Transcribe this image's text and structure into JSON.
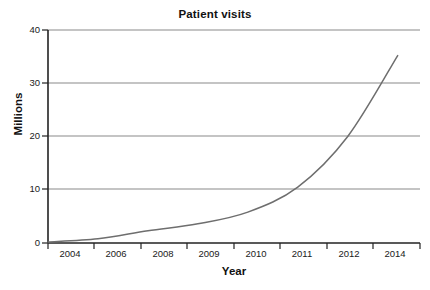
{
  "chart_data": {
    "type": "line",
    "title": "Patient visits",
    "xlabel": "Year",
    "ylabel": "Millions",
    "categories": [
      "2004",
      "2006",
      "2008",
      "2009",
      "2010",
      "2011",
      "2012",
      "2014"
    ],
    "x": [
      2004,
      2006,
      2008,
      2009,
      2010,
      2011,
      2012,
      2014
    ],
    "values": [
      0.2,
      0.8,
      2.3,
      3.6,
      5.8,
      10.5,
      20.0,
      35.2
    ],
    "series": [
      {
        "name": "Patient visits",
        "values": [
          0.2,
          0.8,
          2.3,
          3.6,
          5.8,
          10.5,
          20.0,
          35.2
        ]
      }
    ],
    "ylim": [
      0,
      40
    ],
    "yticks": [
      0,
      10,
      20,
      30,
      40
    ],
    "ytick_labels": [
      "0",
      "10",
      "20",
      "30",
      "40"
    ],
    "xtick_labels": [
      "2004",
      "2006",
      "2008",
      "2009",
      "2010",
      "2011",
      "2012",
      "2014"
    ],
    "grid": "horizontal",
    "legend": "none",
    "line_color": "#6e6e6e",
    "grid_color": "#8a8a8a",
    "axis_color": "#222222",
    "background": "#ffffff"
  },
  "axes": {
    "y_ticks": [
      {
        "label": "40",
        "value": 40
      },
      {
        "label": "30",
        "value": 30
      },
      {
        "label": "20",
        "value": 20
      },
      {
        "label": "10",
        "value": 10
      },
      {
        "label": "0",
        "value": 0
      }
    ],
    "x_ticks": [
      {
        "label": "2004"
      },
      {
        "label": "2006"
      },
      {
        "label": "2008"
      },
      {
        "label": "2009"
      },
      {
        "label": "2010"
      },
      {
        "label": "2011"
      },
      {
        "label": "2012"
      },
      {
        "label": "2014"
      }
    ]
  }
}
